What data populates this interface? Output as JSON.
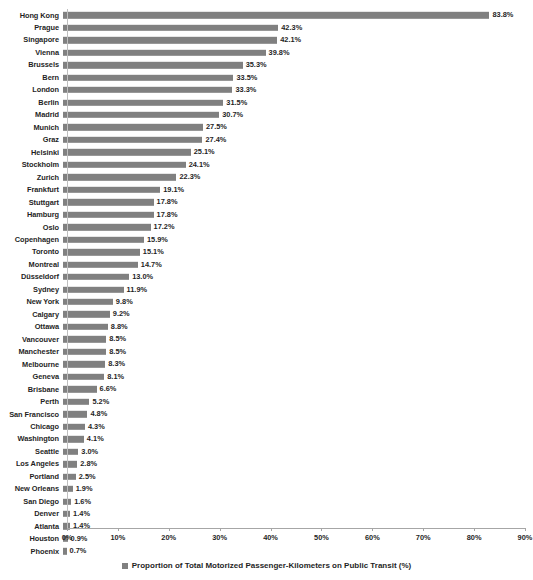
{
  "chart_data": {
    "type": "bar",
    "orientation": "horizontal",
    "title": "",
    "subtitle": "",
    "xlabel": "",
    "ylabel": "",
    "xlim": [
      0,
      90
    ],
    "xtick_step": 10,
    "xticks": [
      "0%",
      "10%",
      "20%",
      "30%",
      "40%",
      "50%",
      "60%",
      "70%",
      "80%",
      "90%"
    ],
    "grid": false,
    "legend_position": "bottom",
    "legend": [
      "Proportion of Total Motorized Passenger-Kilometers on Public Transit (%)"
    ],
    "series_color": "#808080",
    "value_suffix": "%",
    "categories": [
      "Hong Kong",
      "Prague",
      "Singapore",
      "Vienna",
      "Brussels",
      "Bern",
      "London",
      "Berlin",
      "Madrid",
      "Munich",
      "Graz",
      "Helsinki",
      "Stockholm",
      "Zurich",
      "Frankfurt",
      "Stuttgart",
      "Hamburg",
      "Oslo",
      "Copenhagen",
      "Toronto",
      "Montreal",
      "Düsseldorf",
      "Sydney",
      "New York",
      "Calgary",
      "Ottawa",
      "Vancouver",
      "Manchester",
      "Melbourne",
      "Geneva",
      "Brisbane",
      "Perth",
      "San Francisco",
      "Chicago",
      "Washington",
      "Seattle",
      "Los Angeles",
      "Portland",
      "New Orleans",
      "San Diego",
      "Denver",
      "Atlanta",
      "Houston",
      "Phoenix"
    ],
    "values": [
      83.8,
      42.3,
      42.1,
      39.8,
      35.3,
      33.5,
      33.3,
      31.5,
      30.7,
      27.5,
      27.4,
      25.1,
      24.1,
      22.3,
      19.1,
      17.8,
      17.8,
      17.2,
      15.9,
      15.1,
      14.7,
      13.0,
      11.9,
      9.8,
      9.2,
      8.8,
      8.5,
      8.5,
      8.3,
      8.1,
      6.6,
      5.2,
      4.8,
      4.3,
      4.1,
      3.0,
      2.8,
      2.5,
      1.9,
      1.6,
      1.4,
      1.4,
      0.9,
      0.7
    ],
    "value_labels": [
      "83.8%",
      "42.3%",
      "42.1%",
      "39.8%",
      "35.3%",
      "33.5%",
      "33.3%",
      "31.5%",
      "30.7%",
      "27.5%",
      "27.4%",
      "25.1%",
      "24.1%",
      "22.3%",
      "19.1%",
      "17.8%",
      "17.8%",
      "17.2%",
      "15.9%",
      "15.1%",
      "14.7%",
      "13.0%",
      "11.9%",
      "9.8%",
      "9.2%",
      "8.8%",
      "8.5%",
      "8.5%",
      "8.3%",
      "8.1%",
      "6.6%",
      "5.2%",
      "4.8%",
      "4.3%",
      "4.1%",
      "3.0%",
      "2.8%",
      "2.5%",
      "1.9%",
      "1.6%",
      "1.4%",
      "1.4%",
      "0.9%",
      "0.7%"
    ]
  }
}
